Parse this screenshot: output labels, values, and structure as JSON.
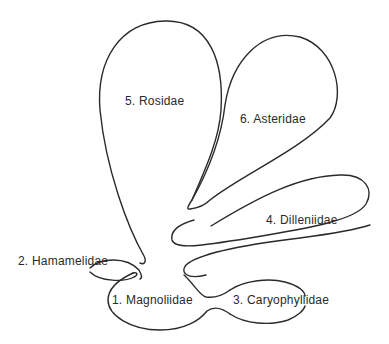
{
  "diagram": {
    "type": "phylogenetic subclass diagram (balloon diagram)",
    "line_color": "#2a2a2a",
    "background": "#ffffff",
    "subclasses": [
      {
        "number": 1,
        "label": "1. Magnoliidae"
      },
      {
        "number": 2,
        "label": "2. Hamamelidae"
      },
      {
        "number": 3,
        "label": "3. Caryophyllidae"
      },
      {
        "number": 4,
        "label": "4. Dilleniidae"
      },
      {
        "number": 5,
        "label": "5. Rosidae"
      },
      {
        "number": 6,
        "label": "6. Asteridae"
      }
    ]
  }
}
